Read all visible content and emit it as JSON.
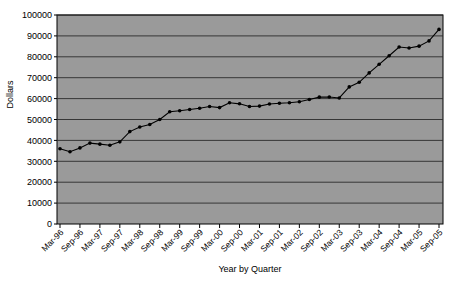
{
  "chart_data": {
    "type": "line",
    "title": "",
    "xlabel": "Year by Quarter",
    "ylabel": "Dollars",
    "ylim": [
      0,
      100000
    ],
    "ytick_labels": [
      "0",
      "10000",
      "20000",
      "30000",
      "40000",
      "50000",
      "60000",
      "70000",
      "80000",
      "90000",
      "100000"
    ],
    "ytick_values": [
      0,
      10000,
      20000,
      30000,
      40000,
      50000,
      60000,
      70000,
      80000,
      90000,
      100000
    ],
    "grid": true,
    "legend": "none",
    "plot_background": "#9a9a9a",
    "page_background": "#ffffff",
    "line_color": "#000000",
    "marker": "circle",
    "x_tick_labels": [
      "Mar-96",
      "Sep-96",
      "Mar-97",
      "Sep-97",
      "Mar-98",
      "Sep-98",
      "Mar-99",
      "Sep-99",
      "Mar-00",
      "Sep-00",
      "Mar-01",
      "Sep-01",
      "Mar-02",
      "Sep-02",
      "Mar-03",
      "Sep-03",
      "Mar-04",
      "Sep-04",
      "Mar-05",
      "Sep-05"
    ],
    "x_tick_interval_quarters": 2,
    "x": [
      "Mar-96",
      "Jun-96",
      "Sep-96",
      "Dec-96",
      "Mar-97",
      "Jun-97",
      "Sep-97",
      "Dec-97",
      "Mar-98",
      "Jun-98",
      "Sep-98",
      "Dec-98",
      "Mar-99",
      "Jun-99",
      "Sep-99",
      "Dec-99",
      "Mar-00",
      "Jun-00",
      "Sep-00",
      "Dec-00",
      "Mar-01",
      "Jun-01",
      "Sep-01",
      "Dec-01",
      "Mar-02",
      "Jun-02",
      "Sep-02",
      "Dec-02",
      "Mar-03",
      "Jun-03",
      "Sep-03",
      "Dec-03",
      "Mar-04",
      "Jun-04",
      "Sep-04",
      "Dec-04",
      "Mar-05",
      "Jun-05",
      "Sep-05"
    ],
    "values": [
      36000,
      34600,
      36400,
      38700,
      38200,
      37700,
      39300,
      44200,
      46400,
      47600,
      50000,
      53700,
      54200,
      54800,
      55400,
      56200,
      55700,
      58000,
      57500,
      56200,
      56400,
      57400,
      57800,
      58000,
      58500,
      59600,
      60700,
      60800,
      60300,
      65600,
      67800,
      72300,
      76400,
      80500,
      84700,
      84200,
      85100,
      87600,
      93100
    ],
    "series_name": "Dollars"
  }
}
